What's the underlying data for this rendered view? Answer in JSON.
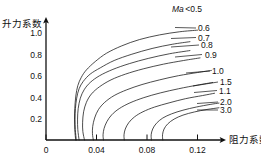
{
  "chart_data": {
    "type": "line",
    "title": "",
    "xlabel": "阻力系数",
    "ylabel": "升力系数",
    "xlim": [
      0,
      0.138
    ],
    "ylim": [
      0,
      1.13
    ],
    "xticks": [
      "0",
      "0.04",
      "0.08",
      "0.12"
    ],
    "xtick_values": [
      0,
      0.04,
      0.08,
      0.12
    ],
    "yticks": [
      "0.2",
      "0.4",
      "0.6",
      "0.8",
      "1.0"
    ],
    "ytick_values": [
      0.2,
      0.4,
      0.6,
      0.8,
      1.0
    ],
    "grid": false,
    "legend_position": "right-inline-labels",
    "annotations": [
      {
        "text_italic": "Ma",
        "text": "<0.5",
        "x": 0.107,
        "y": 1.12
      }
    ],
    "series": [
      {
        "name": "0.6",
        "label": "0.6",
        "points": [
          [
            0.0235,
            0.0
          ],
          [
            0.0228,
            0.1
          ],
          [
            0.0226,
            0.2
          ],
          [
            0.0228,
            0.3
          ],
          [
            0.0236,
            0.42
          ],
          [
            0.0252,
            0.52
          ],
          [
            0.028,
            0.6
          ],
          [
            0.032,
            0.67
          ],
          [
            0.039,
            0.75
          ],
          [
            0.048,
            0.83
          ],
          [
            0.06,
            0.9
          ],
          [
            0.074,
            0.96
          ],
          [
            0.09,
            1.005
          ],
          [
            0.106,
            1.035
          ],
          [
            0.12,
            1.05
          ]
        ]
      },
      {
        "name": "0.7",
        "label": "0.7",
        "points": [
          [
            0.024,
            0.0
          ],
          [
            0.0232,
            0.1
          ],
          [
            0.023,
            0.2
          ],
          [
            0.0233,
            0.3
          ],
          [
            0.0243,
            0.4
          ],
          [
            0.0262,
            0.49
          ],
          [
            0.0295,
            0.56
          ],
          [
            0.035,
            0.63
          ],
          [
            0.043,
            0.69
          ],
          [
            0.054,
            0.76
          ],
          [
            0.068,
            0.82
          ],
          [
            0.084,
            0.875
          ],
          [
            0.1,
            0.915
          ],
          [
            0.114,
            0.94
          ]
        ]
      },
      {
        "name": "0.8",
        "label": "0.8",
        "points": [
          [
            0.0262,
            0.0
          ],
          [
            0.0252,
            0.1
          ],
          [
            0.025,
            0.2
          ],
          [
            0.0255,
            0.3
          ],
          [
            0.0272,
            0.4
          ],
          [
            0.0302,
            0.48
          ],
          [
            0.035,
            0.55
          ],
          [
            0.0425,
            0.615
          ],
          [
            0.053,
            0.675
          ],
          [
            0.066,
            0.73
          ],
          [
            0.081,
            0.78
          ],
          [
            0.098,
            0.825
          ],
          [
            0.114,
            0.855
          ]
        ]
      },
      {
        "name": "0.9",
        "label": "0.9",
        "points": [
          [
            0.0305,
            0.0
          ],
          [
            0.0292,
            0.08
          ],
          [
            0.029,
            0.17
          ],
          [
            0.0298,
            0.27
          ],
          [
            0.032,
            0.36
          ],
          [
            0.036,
            0.44
          ],
          [
            0.0425,
            0.51
          ],
          [
            0.0515,
            0.575
          ],
          [
            0.063,
            0.63
          ],
          [
            0.077,
            0.68
          ],
          [
            0.093,
            0.725
          ],
          [
            0.109,
            0.76
          ],
          [
            0.122,
            0.785
          ]
        ]
      },
      {
        "name": "1.0",
        "label": "1.0",
        "points": [
          [
            0.0375,
            0.0
          ],
          [
            0.0368,
            0.06
          ],
          [
            0.037,
            0.13
          ],
          [
            0.0385,
            0.21
          ],
          [
            0.0415,
            0.29
          ],
          [
            0.0465,
            0.36
          ],
          [
            0.054,
            0.425
          ],
          [
            0.064,
            0.48
          ],
          [
            0.076,
            0.53
          ],
          [
            0.09,
            0.575
          ],
          [
            0.105,
            0.615
          ],
          [
            0.12,
            0.645
          ],
          [
            0.131,
            0.665
          ]
        ]
      },
      {
        "name": "1.5",
        "label": "1.5",
        "points": [
          [
            0.0455,
            0.0
          ],
          [
            0.0452,
            0.05
          ],
          [
            0.046,
            0.11
          ],
          [
            0.0482,
            0.175
          ],
          [
            0.052,
            0.24
          ],
          [
            0.058,
            0.3
          ],
          [
            0.0665,
            0.355
          ],
          [
            0.0775,
            0.405
          ],
          [
            0.0905,
            0.45
          ],
          [
            0.105,
            0.49
          ],
          [
            0.12,
            0.525
          ],
          [
            0.132,
            0.55
          ]
        ]
      },
      {
        "name": "1.1",
        "label": "1.1",
        "points": [
          [
            0.062,
            0.0
          ],
          [
            0.0618,
            0.05
          ],
          [
            0.0628,
            0.105
          ],
          [
            0.0655,
            0.165
          ],
          [
            0.07,
            0.22
          ],
          [
            0.0768,
            0.27
          ],
          [
            0.086,
            0.315
          ],
          [
            0.0975,
            0.355
          ],
          [
            0.1105,
            0.395
          ],
          [
            0.124,
            0.425
          ],
          [
            0.1335,
            0.447
          ]
        ]
      },
      {
        "name": "2.0",
        "label": "2.0",
        "points": [
          [
            0.0835,
            0.0
          ],
          [
            0.0833,
            0.05
          ],
          [
            0.0845,
            0.105
          ],
          [
            0.0875,
            0.16
          ],
          [
            0.0925,
            0.21
          ],
          [
            0.0995,
            0.25
          ],
          [
            0.1085,
            0.285
          ],
          [
            0.119,
            0.315
          ],
          [
            0.13,
            0.34
          ],
          [
            0.137,
            0.353
          ]
        ]
      },
      {
        "name": "3.0",
        "label": "3.0",
        "points": [
          [
            0.0925,
            0.0
          ],
          [
            0.0923,
            0.05
          ],
          [
            0.0935,
            0.105
          ],
          [
            0.0965,
            0.155
          ],
          [
            0.1015,
            0.2
          ],
          [
            0.1085,
            0.238
          ],
          [
            0.1175,
            0.268
          ],
          [
            0.1275,
            0.292
          ],
          [
            0.137,
            0.308
          ]
        ]
      }
    ]
  },
  "axes": {
    "y_title": "升力系数",
    "x_title": "阻力系数"
  },
  "annotation": {
    "mach_italic": "Ma",
    "mach_rest": "<0.5"
  },
  "labels": {
    "l06": "0.6",
    "l07": "0.7",
    "l08": "0.8",
    "l09": "0.9",
    "l10": "1.0",
    "l15": "1.5",
    "l11": "1.1",
    "l20": "2.0",
    "l30": "3.0"
  },
  "xtick_labels": {
    "t0": "0",
    "t1": "0.04",
    "t2": "0.08",
    "t3": "0.12"
  },
  "ytick_labels": {
    "t02": "0.2",
    "t04": "0.4",
    "t06": "0.6",
    "t08": "0.8",
    "t10": "1.0"
  },
  "colors": {
    "ink": "#111111",
    "background": "#ffffff"
  }
}
